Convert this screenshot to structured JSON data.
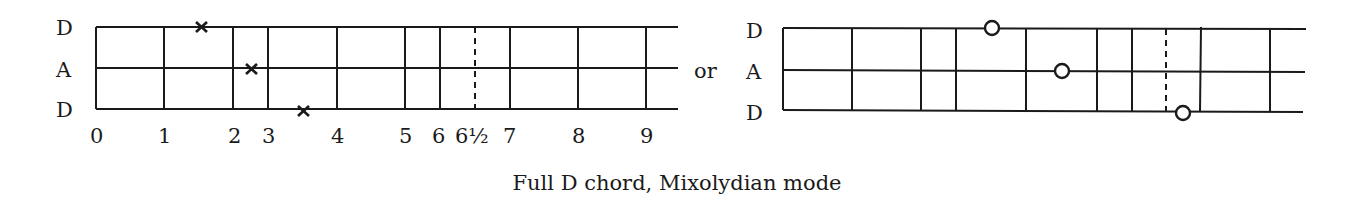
{
  "caption": "Full D chord, Mixolydian mode",
  "connector": "or",
  "colors": {
    "ink": "#1a1a1a",
    "background": "#ffffff"
  },
  "left_diagram": {
    "strings": [
      "D",
      "A",
      "D"
    ],
    "fret_labels": [
      "0",
      "1",
      "2",
      "3",
      "4",
      "5",
      "6",
      "6½",
      "7",
      "8",
      "9"
    ],
    "marker_type": "x-mark",
    "markers": [
      {
        "string": "D (top)",
        "fret": "between 1 and 2"
      },
      {
        "string": "A",
        "fret": "between 2 and 3"
      },
      {
        "string": "D (bottom)",
        "fret": "between 3 and 4"
      }
    ]
  },
  "right_diagram": {
    "strings": [
      "D",
      "A",
      "D"
    ],
    "marker_type": "open-circle",
    "markers": [
      {
        "string": "D (top)",
        "fret": "between 3 and 4"
      },
      {
        "string": "A",
        "fret": "between 4 and 5"
      },
      {
        "string": "D (bottom)",
        "fret": "between 6½ and 7"
      }
    ]
  }
}
